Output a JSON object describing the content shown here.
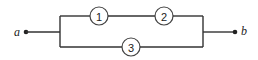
{
  "diagram": {
    "type": "series-parallel network",
    "terminals": [
      {
        "id": "a",
        "label": "a"
      },
      {
        "id": "b",
        "label": "b"
      }
    ],
    "elements": [
      {
        "id": "1",
        "label": "1",
        "branch": "upper",
        "position": "first"
      },
      {
        "id": "2",
        "label": "2",
        "branch": "upper",
        "position": "second"
      },
      {
        "id": "3",
        "label": "3",
        "branch": "lower",
        "position": "only"
      }
    ],
    "structure": "Elements 1 and 2 in series on the upper branch, in parallel with element 3 on the lower branch, between terminals a and b",
    "colors": {
      "line": "#333333",
      "background": "#ffffff"
    }
  }
}
